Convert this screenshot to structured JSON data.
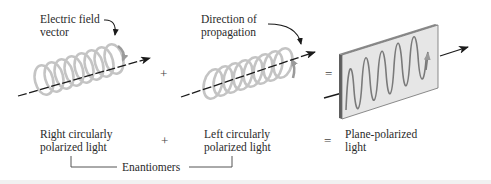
{
  "diagram": {
    "panels": [
      {
        "id": "right-circular",
        "callout": "Electric field vector",
        "callout_lines": [
          "Electric field",
          "vector"
        ],
        "caption_lines": [
          "Right circularly",
          "polarized light"
        ]
      },
      {
        "id": "left-circular",
        "callout_lines": [
          "Direction of",
          "propagation"
        ],
        "caption_lines": [
          "Left circularly",
          "polarized light"
        ]
      },
      {
        "id": "plane-polarized",
        "caption_lines": [
          "Plane-polarized",
          "light"
        ]
      }
    ],
    "operators": {
      "plus_top": "+",
      "equals_top": "=",
      "plus_bottom": "+",
      "equals_bottom": "="
    },
    "bracket_label": "Enantiomers",
    "colors": {
      "helix": "#a8a8a8",
      "arrow": "#1a1a1a",
      "plate_face": "#e6e6e6",
      "plate_edge": "#6e6e6e",
      "wave": "#7a7a7a",
      "text": "#2a2a2a"
    }
  }
}
